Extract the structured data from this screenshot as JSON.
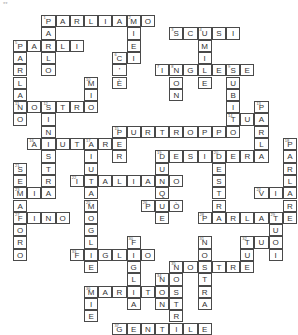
{
  "puzzle": {
    "corner_mark": "**",
    "cell_w": 14.2,
    "cell_h": 12.3,
    "origin_x": 13,
    "origin_y": 15,
    "words": [
      {
        "n": "1",
        "dir": "across",
        "text": "PARLIAMO",
        "row": 0,
        "col": 2
      },
      {
        "n": "1",
        "dir": "down",
        "text": "PARLO",
        "row": 0,
        "col": 2
      },
      {
        "n": "2",
        "dir": "down",
        "text": "MIEI",
        "row": 0,
        "col": 8
      },
      {
        "n": "3",
        "dir": "across",
        "text": "SCUSI",
        "row": 1,
        "col": 11
      },
      {
        "n": "4",
        "dir": "down",
        "text": "UMILE",
        "row": 1,
        "col": 13
      },
      {
        "n": "5",
        "dir": "across",
        "text": "PARLI",
        "row": 2,
        "col": 0
      },
      {
        "n": "5",
        "dir": "down",
        "text": "PARLANO",
        "row": 2,
        "col": 0
      },
      {
        "n": "6",
        "dir": "across",
        "text": "CI",
        "row": 3,
        "col": 7
      },
      {
        "n": "6",
        "dir": "down",
        "text": "C'È",
        "row": 3,
        "col": 7
      },
      {
        "n": "7",
        "dir": "across",
        "text": "INGLESE",
        "row": 4,
        "col": 10
      },
      {
        "n": "8",
        "dir": "down",
        "text": "NON",
        "row": 4,
        "col": 11
      },
      {
        "n": "9",
        "dir": "down",
        "text": "SUBITO",
        "row": 4,
        "col": 15
      },
      {
        "n": "10",
        "dir": "down",
        "text": "MIO",
        "row": 5,
        "col": 5
      },
      {
        "n": "11",
        "dir": "across",
        "text": "NOSTRO",
        "row": 7,
        "col": 0
      },
      {
        "n": "12",
        "dir": "down",
        "text": "SINISTRA",
        "row": 7,
        "col": 2
      },
      {
        "n": "13",
        "dir": "down",
        "text": "PARLA",
        "row": 7,
        "col": 17
      },
      {
        "n": "14",
        "dir": "across",
        "text": "TUA",
        "row": 8,
        "col": 15
      },
      {
        "n": "15",
        "dir": "across",
        "text": "PURTROPPO",
        "row": 9,
        "col": 7
      },
      {
        "n": "15",
        "dir": "down",
        "text": "PER",
        "row": 9,
        "col": 7
      },
      {
        "n": "16",
        "dir": "across",
        "text": "AIUTARE",
        "row": 10,
        "col": 1
      },
      {
        "n": "17",
        "dir": "down",
        "text": "AIUTA",
        "row": 10,
        "col": 5
      },
      {
        "n": "18",
        "dir": "down",
        "text": "PARLARE",
        "row": 10,
        "col": 19
      },
      {
        "n": "19",
        "dir": "across",
        "text": "DESIDERA",
        "row": 11,
        "col": 10
      },
      {
        "n": "19",
        "dir": "down",
        "text": "DUNQUE",
        "row": 11,
        "col": 10
      },
      {
        "n": "20",
        "dir": "down",
        "text": "DESTRA",
        "row": 11,
        "col": 14
      },
      {
        "n": "21",
        "dir": "down",
        "text": "SEMAFORO",
        "row": 12,
        "col": 0
      },
      {
        "n": "22",
        "dir": "across",
        "text": "ITALIANO",
        "row": 13,
        "col": 4
      },
      {
        "n": "23",
        "dir": "across",
        "text": "MIA",
        "row": 14,
        "col": 0
      },
      {
        "n": "24",
        "dir": "across",
        "text": "VIA",
        "row": 14,
        "col": 17
      },
      {
        "n": "25",
        "dir": "down",
        "text": "MOGLIE",
        "row": 15,
        "col": 5
      },
      {
        "n": "26",
        "dir": "across",
        "text": "PUÒ",
        "row": 15,
        "col": 9
      },
      {
        "n": "27",
        "dir": "across",
        "text": "FINO",
        "row": 16,
        "col": 0
      },
      {
        "n": "28",
        "dir": "across",
        "text": "PARLATE",
        "row": 16,
        "col": 13
      },
      {
        "n": "29",
        "dir": "down",
        "text": "TUOI",
        "row": 16,
        "col": 18
      },
      {
        "n": "30",
        "dir": "down",
        "text": "FIGLIA",
        "row": 18,
        "col": 8
      },
      {
        "n": "31",
        "dir": "down",
        "text": "NOSTRA",
        "row": 18,
        "col": 13
      },
      {
        "n": "32",
        "dir": "across",
        "text": "TUO",
        "row": 18,
        "col": 16
      },
      {
        "n": "32",
        "dir": "down",
        "text": "TUE",
        "row": 18,
        "col": 16
      },
      {
        "n": "33",
        "dir": "across",
        "text": "FIGLIO",
        "row": 19,
        "col": 4
      },
      {
        "n": "34",
        "dir": "down",
        "text": "NON",
        "row": 21,
        "col": 10
      },
      {
        "n": "35",
        "dir": "across",
        "text": "NOSTRE",
        "row": 20,
        "col": 11
      },
      {
        "n": "35",
        "dir": "down",
        "text": "NOSTRI",
        "row": 20,
        "col": 11
      },
      {
        "n": "36",
        "dir": "across",
        "text": "MARITO",
        "row": 22,
        "col": 5
      },
      {
        "n": "36",
        "dir": "down",
        "text": "MIE",
        "row": 22,
        "col": 5
      },
      {
        "n": "37",
        "dir": "across",
        "text": "GENTILE",
        "row": 25,
        "col": 7
      }
    ]
  }
}
